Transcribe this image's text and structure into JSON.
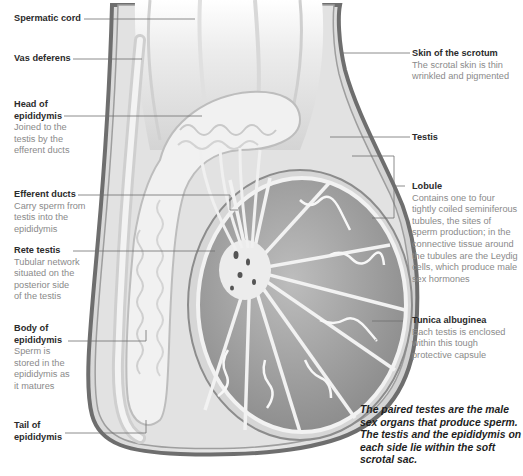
{
  "diagram": {
    "labels": {
      "spermatic_cord": {
        "title": "Spermatic cord",
        "desc": ""
      },
      "vas_deferens": {
        "title": "Vas deferens",
        "desc": ""
      },
      "head_epididymis": {
        "title_1": "Head of",
        "title_2": "epididymis",
        "desc_1": "Joined to the",
        "desc_2": "testis by the",
        "desc_3": "efferent ducts"
      },
      "efferent_ducts": {
        "title": "Efferent ducts",
        "desc_1": "Carry sperm from",
        "desc_2": "testis into the",
        "desc_3": "epididymis"
      },
      "rete_testis": {
        "title": "Rete testis",
        "desc_1": "Tubular network",
        "desc_2": "situated on the",
        "desc_3": "posterior side",
        "desc_4": "of the testis"
      },
      "body_epididymis": {
        "title_1": "Body of",
        "title_2": "epididymis",
        "desc_1": "Sperm is",
        "desc_2": "stored in the",
        "desc_3": "epididymis as",
        "desc_4": "it matures"
      },
      "tail_epididymis": {
        "title_1": "Tail of",
        "title_2": "epididymis"
      },
      "skin_scrotum": {
        "title": "Skin of the scrotum",
        "desc_1": "The scrotal skin is thin",
        "desc_2": "wrinkled and pigmented"
      },
      "testis": {
        "title": "Testis"
      },
      "lobule": {
        "title": "Lobule",
        "desc_1": "Contains one to four",
        "desc_2": "tightly coiled seminiferous",
        "desc_3": "tubules, the sites of",
        "desc_4": "sperm production; in the",
        "desc_5": "connective tissue around",
        "desc_6": "the tubules are the Leydig",
        "desc_7": "cells, which produce male",
        "desc_8": "sex hormones"
      },
      "tunica_albuginea": {
        "title": "Tunica albuginea",
        "desc_1": "Each testis is enclosed",
        "desc_2": "within this tough",
        "desc_3": "protective capsule"
      }
    },
    "caption": {
      "line_1": "The paired testes are the male",
      "line_2": "sex organs that produce sperm.",
      "line_3": "The testis and the epididymis on",
      "line_4": "each side lie within the soft",
      "line_5": "scrotal sac."
    },
    "colors": {
      "title_text": "#2b2b2b",
      "desc_text": "#8a8a8a",
      "leader_line": "#6f6f6f",
      "scrotum_wall": "#7a7a7a",
      "tissue_gray": "#9a9a9a",
      "tubule_white": "#f4f4f4"
    }
  }
}
